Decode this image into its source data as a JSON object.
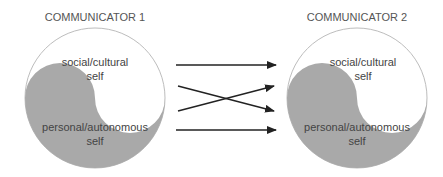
{
  "diagram": {
    "communicators": [
      {
        "title": "COMMUNICATOR 1",
        "top_label_line1": "social/cultural",
        "top_label_line2": "self",
        "bottom_label_line1": "personal/autonomous",
        "bottom_label_line2": "self"
      },
      {
        "title": "COMMUNICATOR 2",
        "top_label_line1": "social/cultural",
        "top_label_line2": "self",
        "bottom_label_line1": "personal/autonomous",
        "bottom_label_line2": "self"
      }
    ],
    "arrows": [
      {
        "from": "top",
        "to": "top",
        "type": "straight"
      },
      {
        "from": "upper-middle",
        "to": "lower-middle",
        "type": "cross"
      },
      {
        "from": "lower-middle",
        "to": "upper-middle",
        "type": "cross"
      },
      {
        "from": "bottom",
        "to": "bottom",
        "type": "straight"
      }
    ],
    "colors": {
      "shaded": "#a9a9a9",
      "outline": "#bdbdbd",
      "arrow": "#222222",
      "text": "#444444"
    }
  }
}
